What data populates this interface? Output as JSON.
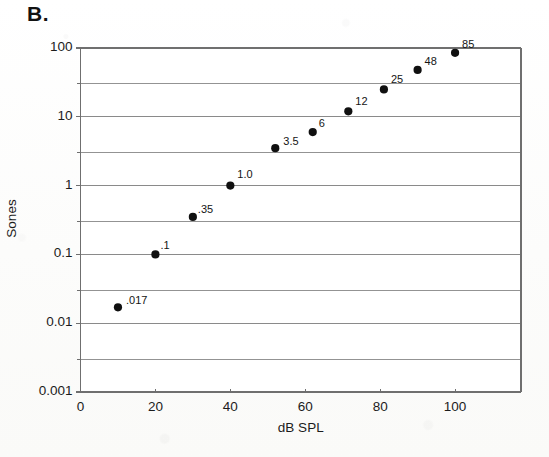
{
  "panel": {
    "label": "B."
  },
  "axes": {
    "x_title": "dB SPL",
    "y_title": "Sones",
    "x_ticks": [
      "0",
      "20",
      "40",
      "60",
      "80",
      "100"
    ],
    "y_ticks": [
      "100",
      "10",
      "1",
      "0.1",
      "0.01",
      "0.001"
    ]
  },
  "colors": {
    "axis": "#6f6f6f",
    "grid": "#8a8a8a",
    "marker": "#101010",
    "text": "#1c1c1c",
    "background": "#fdfdfc"
  },
  "chart_data": {
    "type": "scatter",
    "title": "",
    "xlabel": "dB SPL",
    "ylabel": "Sones",
    "xlim": [
      0,
      117.6
    ],
    "ylim": [
      0.001,
      100
    ],
    "yscale": "log",
    "xscale": "linear",
    "grid": true,
    "legend": "none",
    "x_ticks": [
      0,
      20,
      40,
      60,
      80,
      100
    ],
    "y_ticks": [
      100,
      10,
      1,
      0.1,
      0.01,
      0.001
    ],
    "y_minor_gridlines": [
      30,
      3,
      0.3,
      0.03,
      0.003
    ],
    "x": [
      10,
      20,
      30,
      40,
      52,
      62,
      71.5,
      81,
      90,
      100
    ],
    "y": [
      0.017,
      0.1,
      0.35,
      1.0,
      3.5,
      6,
      12,
      25,
      48,
      85
    ],
    "point_labels": [
      ".017",
      ".1",
      ".35",
      "1.0",
      "3.5",
      "6",
      "12",
      "25",
      "48",
      "85"
    ]
  }
}
